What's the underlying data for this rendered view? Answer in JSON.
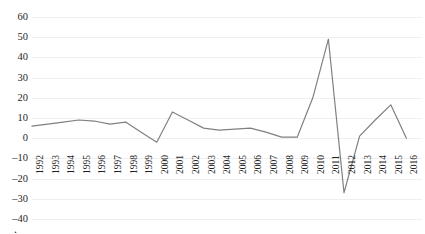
{
  "chart_data": {
    "type": "line",
    "title": "",
    "subtitle": "",
    "xlabel": "",
    "ylabel": "",
    "grid": true,
    "legend": "none",
    "line_color": "#808080",
    "categories": [
      "1992",
      "1993",
      "1994",
      "1995",
      "1996",
      "1997",
      "1998",
      "1999",
      "2000",
      "2001",
      "2002",
      "2003",
      "2004",
      "2005",
      "2006",
      "2007",
      "2008",
      "2009",
      "2010",
      "2011",
      "2012",
      "2013",
      "2014",
      "2015",
      "2016",
      "2017"
    ],
    "series": [
      {
        "name": "",
        "values": [
          6,
          7,
          8,
          9,
          8.5,
          7,
          8,
          3,
          -2,
          13,
          9,
          5,
          4,
          4.5,
          5,
          3,
          0.5,
          0.5,
          20,
          49,
          -27,
          1,
          9,
          16.5,
          0,
          null
        ]
      }
    ],
    "ylim": [
      -40,
      60
    ],
    "ytick_step": 10,
    "yticks": [
      "60",
      "50",
      "40",
      "30",
      "20",
      "10",
      "0",
      "–10",
      "–20",
      "–30",
      "–40"
    ],
    "ytick_values": [
      60,
      50,
      40,
      30,
      20,
      10,
      0,
      -10,
      -20,
      -30,
      -40
    ],
    "peak_year": "2011",
    "peak_value": 49,
    "trough_year": "2012",
    "trough_value": -27
  },
  "caption": {
    "cutoff_text": "."
  },
  "colors": {
    "line": "#808080",
    "gridline": "#efefef",
    "text": "#1f1f1f",
    "background": "#ffffff"
  }
}
